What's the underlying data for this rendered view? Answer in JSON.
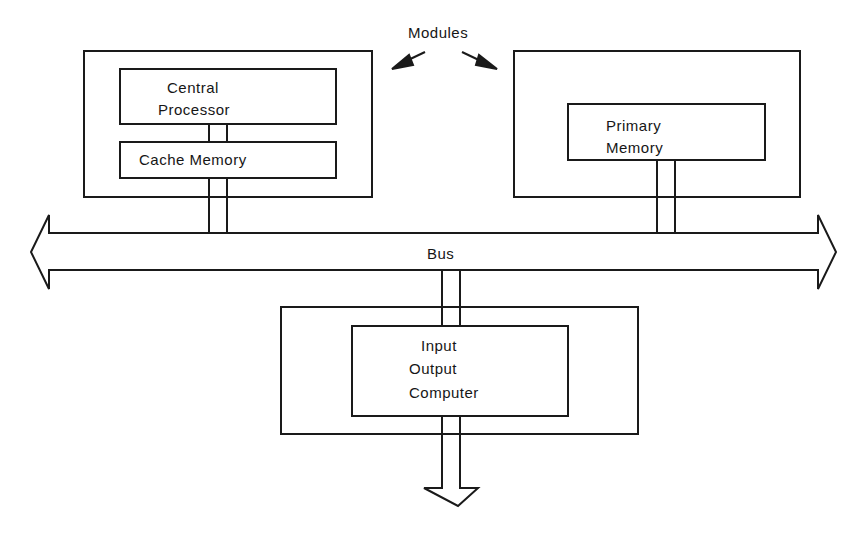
{
  "diagram": {
    "title_label": "Modules",
    "bus_label": "Bus",
    "modules": [
      {
        "id": "processor-module",
        "components": [
          {
            "id": "central-processor",
            "lines": [
              "Central",
              "Processor"
            ]
          },
          {
            "id": "cache-memory",
            "lines": [
              "Cache Memory"
            ]
          }
        ]
      },
      {
        "id": "memory-module",
        "components": [
          {
            "id": "primary-memory",
            "lines": [
              "Primary",
              "Memory"
            ]
          }
        ]
      },
      {
        "id": "io-module",
        "components": [
          {
            "id": "io-computer",
            "lines": [
              "Input",
              "Output",
              "Computer"
            ]
          }
        ]
      }
    ],
    "connections": [
      {
        "from": "central-processor",
        "to": "cache-memory"
      },
      {
        "from": "cache-memory",
        "to": "bus"
      },
      {
        "from": "primary-memory",
        "to": "bus"
      },
      {
        "from": "bus",
        "to": "io-computer"
      },
      {
        "from": "io-computer",
        "to": "external-output"
      }
    ],
    "colors": {
      "stroke": "#1a1a1a",
      "background": "#ffffff"
    }
  }
}
